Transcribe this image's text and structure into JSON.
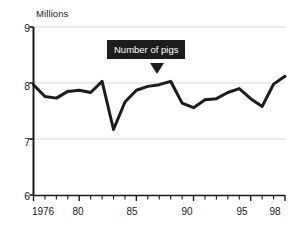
{
  "chart_data": {
    "type": "line",
    "title": "",
    "ylabel": "Millions",
    "xlabel": "",
    "ylim": [
      6,
      9
    ],
    "xlim": [
      1976,
      1998
    ],
    "grid": true,
    "gridlines_y": [
      7,
      8,
      9
    ],
    "y_ticks": [
      "9",
      "8",
      "7",
      "6"
    ],
    "y_tick_values": [
      9,
      8,
      7,
      6
    ],
    "x_ticks": [
      "1976",
      "80",
      "85",
      "90",
      "95",
      "98"
    ],
    "x_tick_values": [
      1976,
      1980,
      1985,
      1990,
      1995,
      1998
    ],
    "minor_x_ticks_every": 1,
    "legend": "none",
    "annotation": {
      "text": "Number of pigs",
      "points_to_year": 1987,
      "points_to_value": 7.97
    },
    "series": [
      {
        "name": "Number of pigs",
        "color": "#1c1c1c",
        "x": [
          1976,
          1977,
          1978,
          1979,
          1980,
          1981,
          1982,
          1983,
          1984,
          1985,
          1986,
          1987,
          1988,
          1989,
          1990,
          1991,
          1992,
          1993,
          1994,
          1995,
          1996,
          1997,
          1998
        ],
        "values": [
          7.97,
          7.76,
          7.73,
          7.85,
          7.87,
          7.83,
          8.03,
          7.17,
          7.66,
          7.87,
          7.94,
          7.97,
          8.03,
          7.64,
          7.56,
          7.7,
          7.72,
          7.83,
          7.9,
          7.72,
          7.58,
          7.98,
          8.12
        ]
      }
    ]
  },
  "axis": {
    "y_title": "Millions",
    "y_labels": [
      "9",
      "8",
      "7",
      "6"
    ],
    "x_labels": [
      "1976",
      "80",
      "85",
      "90",
      "95",
      "98"
    ]
  },
  "callout": {
    "label": "Number of pigs"
  },
  "colors": {
    "line": "#1c1c1c",
    "axis": "#1a1a1a",
    "grid": "#d9d9d9",
    "callout_bg": "#1c1c1c",
    "callout_text": "#ffffff",
    "background": "#ffffff"
  }
}
